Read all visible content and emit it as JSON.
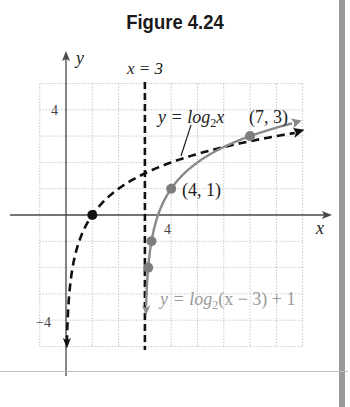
{
  "figure": {
    "title": "Figure 4.24"
  },
  "chart_data": {
    "type": "line",
    "title": "Figure 4.24",
    "xlabel": "x",
    "ylabel": "y",
    "xlim": [
      -1,
      9
    ],
    "ylim": [
      -5,
      5
    ],
    "grid": true,
    "x_ticks_labeled": [
      {
        "value": 4,
        "label": "4"
      }
    ],
    "y_ticks_labeled": [
      {
        "value": 4,
        "label": "4"
      },
      {
        "value": -4,
        "label": "−4"
      }
    ],
    "asymptote": {
      "label": "x = 3",
      "x": 3,
      "style": "dashed",
      "color": "#111111"
    },
    "series": [
      {
        "name": "y = log2x",
        "label_main": "y = log",
        "label_sub": "2",
        "label_tail": "x",
        "style": "dashed",
        "color": "#111111",
        "function": "log2(x)",
        "points": [
          {
            "x": 1,
            "y": 0
          }
        ],
        "sample": [
          [
            0.03,
            -5.06
          ],
          [
            0.0625,
            -4
          ],
          [
            0.125,
            -3
          ],
          [
            0.25,
            -2
          ],
          [
            0.5,
            -1
          ],
          [
            1,
            0
          ],
          [
            2,
            1
          ],
          [
            4,
            2
          ],
          [
            8,
            3
          ],
          [
            9,
            3.17
          ]
        ]
      },
      {
        "name": "y = log2(x − 3) + 1",
        "label_main": "y = log",
        "label_sub": "2",
        "label_tail": "(x − 3) + 1",
        "style": "solid",
        "color": "#8a8a8a",
        "function": "log2(x-3)+1",
        "points": [
          {
            "x": 3.125,
            "y": -2
          },
          {
            "x": 3.25,
            "y": -1
          },
          {
            "x": 4,
            "y": 1
          },
          {
            "x": 7,
            "y": 3
          }
        ],
        "sample": [
          [
            3.035,
            -3.8
          ],
          [
            3.0625,
            -3
          ],
          [
            3.125,
            -2
          ],
          [
            3.25,
            -1
          ],
          [
            3.5,
            0
          ],
          [
            4,
            1
          ],
          [
            5,
            2
          ],
          [
            7,
            3
          ],
          [
            9,
            3.58
          ]
        ]
      }
    ],
    "annotations": [
      {
        "text": "(7, 3)",
        "x": 7,
        "y": 3
      },
      {
        "text": "(4, 1)",
        "x": 4,
        "y": 1
      },
      {
        "text": "x = 3",
        "x": 3,
        "y": 5.6
      }
    ]
  },
  "labels": {
    "x_axis": "x",
    "y_axis": "y",
    "asymptote": "x = 3",
    "tick_x4": "4",
    "tick_y4": "4",
    "tick_yneg4": "−4",
    "point_73": "(7, 3)",
    "point_41": "(4, 1)",
    "log2x_pre": "y = log",
    "log2x_sub": "2",
    "log2x_post": "x",
    "shifted_pre": "y = log",
    "shifted_sub": "2",
    "shifted_post": "(x − 3) + 1"
  },
  "colors": {
    "black_curve": "#111111",
    "gray_curve": "#8a8a8a",
    "gray_point": "#7d7d7d",
    "grid": "#c8c8c8",
    "axis": "#4a4a4a",
    "gray_label": "#9a9a9a"
  }
}
